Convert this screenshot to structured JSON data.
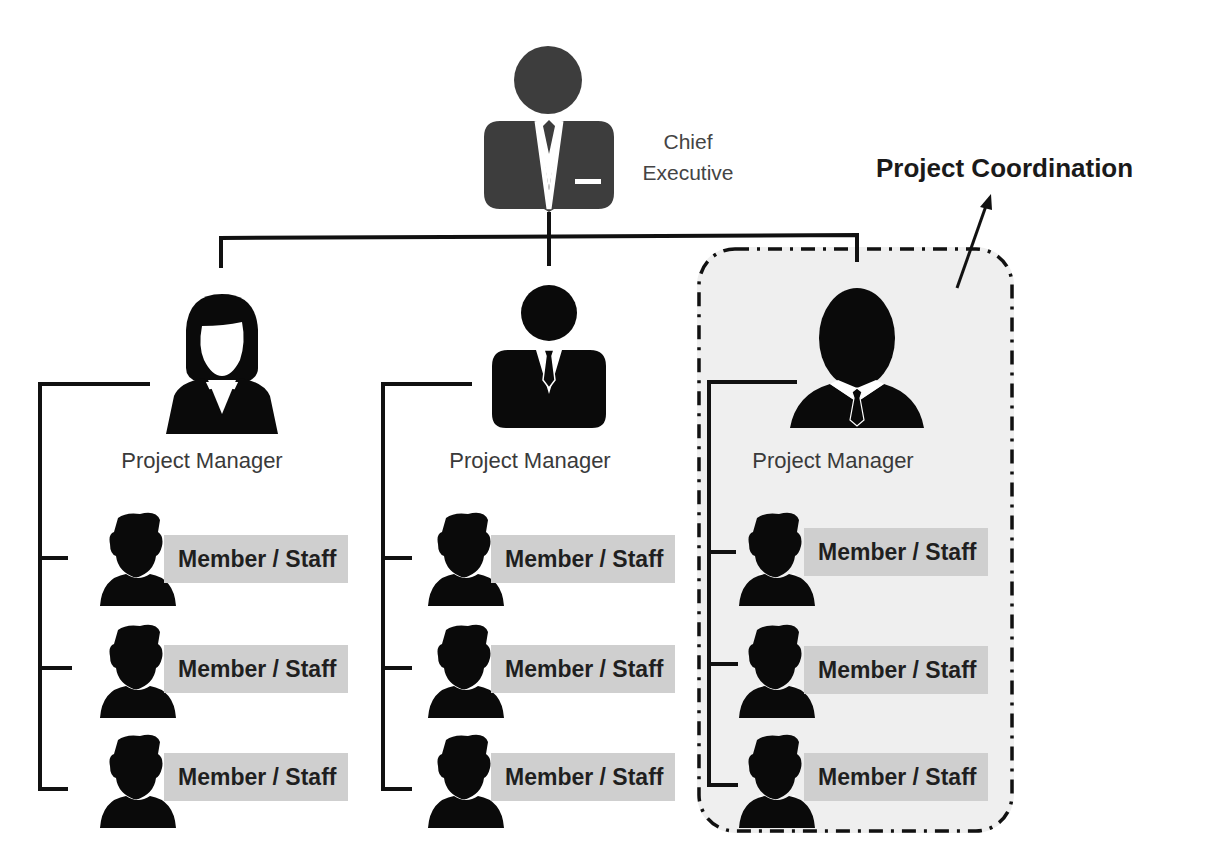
{
  "diagram": {
    "type": "org-chart",
    "colors": {
      "line": "#111111",
      "executive_icon": "#3d3d3d",
      "person_icon": "#0a0a0a",
      "label_box": "#cfcfcf",
      "highlight_region": "#efefef"
    },
    "executive": {
      "label_line1": "Chief",
      "label_line2": "Executive",
      "icon": "businessman-icon"
    },
    "highlight": {
      "title": "Project Coordination",
      "style": "dash-dot rounded rectangle",
      "wraps": "manager_3"
    },
    "managers": [
      {
        "label": "Project Manager",
        "icon": "businesswoman-icon",
        "members": [
          {
            "label": "Member / Staff"
          },
          {
            "label": "Member / Staff"
          },
          {
            "label": "Member / Staff"
          }
        ]
      },
      {
        "label": "Project Manager",
        "icon": "businessman-tie-icon",
        "members": [
          {
            "label": "Member / Staff"
          },
          {
            "label": "Member / Staff"
          },
          {
            "label": "Member / Staff"
          }
        ]
      },
      {
        "label": "Project Manager",
        "icon": "businessman-oval-head-icon",
        "members": [
          {
            "label": "Member / Staff"
          },
          {
            "label": "Member / Staff"
          },
          {
            "label": "Member / Staff"
          }
        ]
      }
    ]
  }
}
